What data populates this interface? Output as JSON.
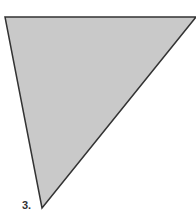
{
  "figure": {
    "label": "3.",
    "shape": "triangle",
    "vertices": [
      [
        5,
        17
      ],
      [
        196,
        17
      ],
      [
        42,
        208
      ]
    ],
    "fill_color": "#c9c9c9",
    "stroke_color": "#333333",
    "stroke_width": 1.5
  }
}
